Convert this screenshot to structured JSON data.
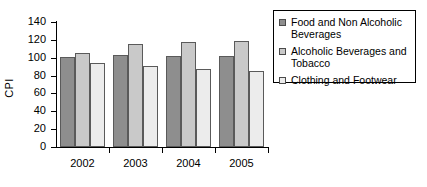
{
  "chart_data": {
    "type": "bar",
    "title": "",
    "xlabel": "",
    "ylabel": "CPI",
    "categories": [
      "2002",
      "2003",
      "2004",
      "2005"
    ],
    "ylim": [
      0,
      140
    ],
    "yticks": [
      0,
      20,
      40,
      60,
      80,
      100,
      120,
      140
    ],
    "grid": false,
    "legend_position": "upper right",
    "series": [
      {
        "name": "Food and Non Alcoholic Beverages",
        "color": "#8e8e8e",
        "values": [
          101,
          103,
          102,
          102
        ]
      },
      {
        "name": "Alcoholic Beverages and Tobacco",
        "color": "#c9c9c9",
        "values": [
          105,
          115,
          118,
          119
        ]
      },
      {
        "name": "Clothing and Footwear",
        "color": "#ececec",
        "values": [
          94,
          91,
          87,
          85
        ]
      }
    ]
  }
}
